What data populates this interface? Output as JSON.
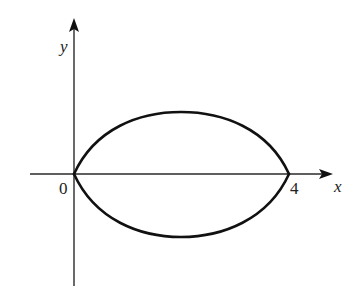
{
  "diagram": {
    "type": "coordinate-plot",
    "axes": {
      "x_label": "x",
      "y_label": "y",
      "origin_label": "0"
    },
    "tick_labels": {
      "x_right": "4"
    },
    "curves": [
      {
        "name": "upper-arc",
        "from": [
          0,
          0
        ],
        "to": [
          4,
          0
        ],
        "side": "above x-axis"
      },
      {
        "name": "lower-arc",
        "from": [
          0,
          0
        ],
        "to": [
          4,
          0
        ],
        "side": "below x-axis"
      }
    ],
    "colors": {
      "ink": "#111111",
      "background": "#ffffff"
    }
  }
}
